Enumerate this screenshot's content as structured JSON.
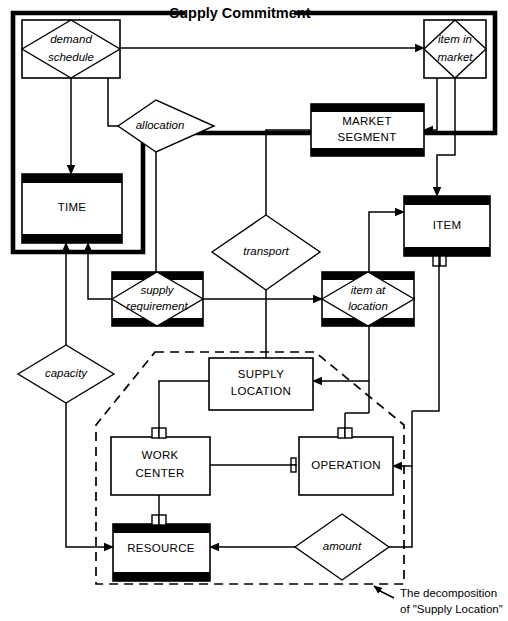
{
  "diagram": {
    "type": "entity-relationship-diagram",
    "title": "Supply Commitment",
    "caption_line1": "The decomposition",
    "caption_line2": "of \"Supply Location\"",
    "colors": {
      "stroke": "#000000",
      "fill": "#ffffff",
      "entity_bar": "#000000"
    },
    "entities": [
      {
        "id": "time",
        "label": "TIME",
        "style": "barred-entity"
      },
      {
        "id": "market-segment",
        "label_line1": "MARKET",
        "label_line2": "SEGMENT",
        "style": "barred-entity"
      },
      {
        "id": "item",
        "label": "ITEM",
        "style": "barred-entity"
      },
      {
        "id": "supply-location",
        "label_line1": "SUPPLY",
        "label_line2": "LOCATION",
        "style": "plain-entity"
      },
      {
        "id": "work-center",
        "label_line1": "WORK",
        "label_line2": "CENTER",
        "style": "plain-entity"
      },
      {
        "id": "operation",
        "label": "OPERATION",
        "style": "plain-entity"
      },
      {
        "id": "resource",
        "label": "RESOURCE",
        "style": "barred-entity"
      }
    ],
    "associative_entities": [
      {
        "id": "demand-schedule",
        "label_line1": "demand",
        "label_line2": "schedule",
        "style": "diamond-in-box"
      },
      {
        "id": "item-in-market",
        "label_line1": "item in",
        "label_line2": "market",
        "style": "diamond-in-box"
      },
      {
        "id": "supply-requirement",
        "label_line1": "supply",
        "label_line2": "requirement",
        "style": "diamond-in-barred-box"
      },
      {
        "id": "item-at-location",
        "label_line1": "item at",
        "label_line2": "location",
        "style": "diamond-in-barred-box"
      }
    ],
    "relationships": [
      {
        "id": "allocation",
        "label": "allocation",
        "style": "diamond"
      },
      {
        "id": "transport",
        "label": "transport",
        "style": "diamond"
      },
      {
        "id": "capacity",
        "label": "capacity",
        "style": "diamond"
      },
      {
        "id": "amount",
        "label": "amount",
        "style": "diamond"
      }
    ],
    "groupings": [
      {
        "id": "supply-commitment-boundary",
        "label": "Supply Commitment",
        "style": "thick-solid"
      },
      {
        "id": "supply-location-decomposition-boundary",
        "label": "",
        "style": "dash-dot"
      }
    ]
  }
}
